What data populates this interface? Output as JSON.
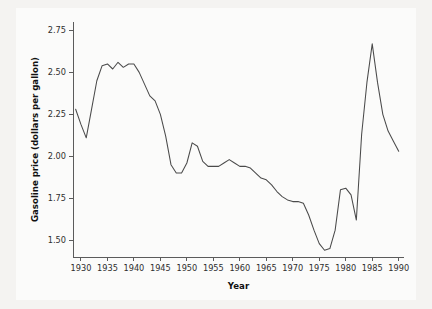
{
  "chart_data": {
    "type": "line",
    "title": "",
    "xlabel": "Year",
    "ylabel": "Gasoline price (dollars per gallon)",
    "xlim": [
      1928.5,
      1991.0
    ],
    "ylim": [
      1.4,
      2.8
    ],
    "grid": false,
    "legend": false,
    "xticks": [
      1930,
      1935,
      1940,
      1945,
      1950,
      1955,
      1960,
      1965,
      1970,
      1975,
      1980,
      1985,
      1990
    ],
    "xtick_labels": [
      "1930",
      "1935",
      "1940",
      "1945",
      "1950",
      "1955",
      "1960",
      "1965",
      "1970",
      "1975",
      "1980",
      "1985",
      "1990"
    ],
    "yticks": [
      1.5,
      1.75,
      2.0,
      2.25,
      2.5,
      2.75
    ],
    "ytick_labels": [
      "1.50",
      "1.75",
      "2.00",
      "2.25",
      "2.50",
      "2.75"
    ],
    "series": [
      {
        "name": "Gasoline price",
        "color": "#4a4a4a",
        "x": [
          1929,
          1930,
          1931,
          1932,
          1933,
          1934,
          1935,
          1936,
          1937,
          1938,
          1939,
          1940,
          1941,
          1942,
          1943,
          1944,
          1945,
          1946,
          1947,
          1948,
          1949,
          1950,
          1951,
          1952,
          1953,
          1954,
          1955,
          1956,
          1957,
          1958,
          1959,
          1960,
          1961,
          1962,
          1963,
          1964,
          1965,
          1966,
          1967,
          1968,
          1969,
          1970,
          1971,
          1972,
          1973,
          1974,
          1975,
          1976,
          1977,
          1978,
          1979,
          1980,
          1981,
          1982,
          1983,
          1984,
          1985,
          1986,
          1987,
          1988,
          1989,
          1990
        ],
        "y": [
          2.28,
          2.19,
          2.11,
          2.28,
          2.45,
          2.54,
          2.55,
          2.52,
          2.56,
          2.53,
          2.55,
          2.55,
          2.5,
          2.43,
          2.36,
          2.33,
          2.25,
          2.12,
          1.95,
          1.9,
          1.9,
          1.96,
          2.08,
          2.06,
          1.97,
          1.94,
          1.94,
          1.94,
          1.96,
          1.98,
          1.96,
          1.94,
          1.94,
          1.93,
          1.9,
          1.87,
          1.86,
          1.83,
          1.79,
          1.76,
          1.74,
          1.73,
          1.73,
          1.72,
          1.65,
          1.56,
          1.48,
          1.44,
          1.45,
          1.56,
          1.8,
          1.81,
          1.77,
          1.62,
          2.13,
          2.44,
          2.67,
          2.44,
          2.25,
          2.15,
          2.09,
          2.03
        ],
        "annotations": [
          {
            "label": "start 1929",
            "value": 2.28
          },
          {
            "label": "early-1930s trough 1931",
            "value": 2.11
          },
          {
            "label": "mid-1930s plateau peak 1937",
            "value": 2.56
          },
          {
            "label": "postwar low 1948-1949",
            "value": 1.9
          },
          {
            "label": "1951 bump",
            "value": 2.08
          },
          {
            "label": "1974 trough",
            "value": 1.44
          },
          {
            "label": "1976 local peak",
            "value": 1.81
          },
          {
            "label": "1979 dip",
            "value": 1.62
          },
          {
            "label": "1981 all-time peak",
            "value": 2.67
          },
          {
            "label": "1987 low",
            "value": 1.51
          },
          {
            "label": "1990 end",
            "value": 1.57
          }
        ]
      }
    ]
  }
}
